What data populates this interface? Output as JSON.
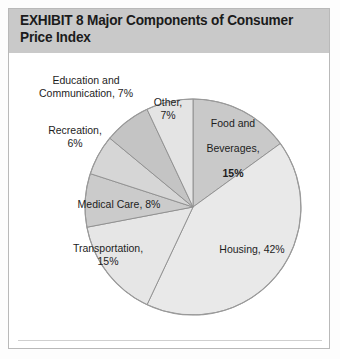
{
  "exhibit": {
    "title": "EXHIBIT 8   Major Components of Consumer\nPrice Index",
    "title_band_color": "#c9c9c9",
    "frame_border_color": "#b9b9b9",
    "background_color": "#ffffff"
  },
  "labels": {
    "education": "Education and\nCommunication, 7%",
    "recreation": "Recreation,\n6%",
    "medical": "Medical Care, 8%",
    "transportation": "Transportation,\n15%",
    "other": "Other,\n7%",
    "food_l1": "Food and",
    "food_l2": "Beverages,",
    "food_l3": "15%",
    "housing": "Housing, 42%"
  },
  "chart_data": {
    "type": "pie",
    "title": "EXHIBIT 8   Major Components of Consumer Price Index",
    "xlabel": "",
    "ylabel": "",
    "units": "percent",
    "total": 100,
    "start_angle_deg": 0,
    "direction": "clockwise",
    "legend_position": "labels-on-chart",
    "grid": false,
    "categories": [
      "Food and Beverages",
      "Housing",
      "Transportation",
      "Medical Care",
      "Recreation",
      "Education and Communication",
      "Other"
    ],
    "values": [
      15,
      42,
      15,
      8,
      6,
      7,
      7
    ],
    "slice_labels": [
      "Food and Beverages, 15%",
      "Housing, 42%",
      "Transportation, 15%",
      "Medical Care, 8%",
      "Recreation, 6%",
      "Education and Communication, 7%",
      "Other, 7%"
    ],
    "slice_colors": [
      "#c9c9c9",
      "#e9e9e9",
      "#e6e6e6",
      "#cbcbcb",
      "#d6d6d6",
      "#c4c4c4",
      "#e4e4e4"
    ],
    "stroke_color": "#8d8d8d",
    "center_x": 193,
    "center_y": 207,
    "radius": 108
  }
}
